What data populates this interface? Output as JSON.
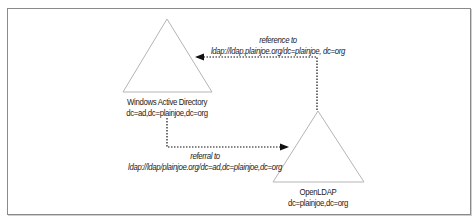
{
  "diagram": {
    "type": "ldap-referral-diagram",
    "nodes": [
      {
        "id": "ad",
        "name": "Windows Active Directory",
        "dn": "dc=ad,dc=plainjoe,dc=org",
        "shape": "triangle"
      },
      {
        "id": "openldap",
        "name": "OpenLDAP",
        "dn": "dc=plainjoe,dc=org",
        "shape": "triangle"
      }
    ],
    "edges": [
      {
        "from": "openldap",
        "to": "ad",
        "label_line1": "reference to",
        "label_line2": "ldap://ldap.plainjoe.org/dc=plainjoe, dc=org",
        "style": "dotted"
      },
      {
        "from": "ad",
        "to": "openldap",
        "label_line1": "referral to",
        "label_line2": "ldap://ldap/plainjoe.org/dc=ad,dc=plainjoe,dc=org",
        "style": "dotted"
      }
    ],
    "colors": {
      "frame": "#8a8a8a",
      "triangle": "#b5b5b5",
      "arrow": "#111111",
      "text": "#222222"
    }
  }
}
